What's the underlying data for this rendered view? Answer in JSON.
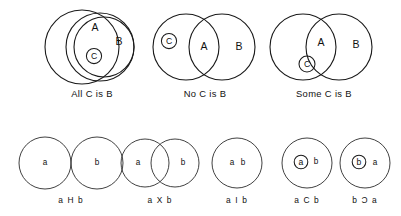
{
  "figure": {
    "background_color": "#ffffff",
    "ink_color": "#1a1a1a",
    "top_row": {
      "diagrams": [
        {
          "id": "all-c-is-b",
          "caption": "All  C is B",
          "set_labels": {
            "a": "A",
            "b": "B",
            "c": "C"
          },
          "relation": "C inside A, A inside B"
        },
        {
          "id": "no-c-is-b",
          "caption": "No C is B",
          "set_labels": {
            "a": "A",
            "b": "B",
            "c": "C"
          },
          "relation": "C outside B, A overlaps B"
        },
        {
          "id": "some-c-is-b",
          "caption": "Some C is B",
          "set_labels": {
            "a": "A",
            "b": "B",
            "c": "C"
          },
          "relation": "C straddles boundary of A and B"
        }
      ]
    },
    "bottom_row": {
      "diagrams": [
        {
          "id": "a-h-b",
          "label": "a H b",
          "left_token": "a",
          "right_token": "b",
          "relation": "disjoint"
        },
        {
          "id": "a-x-b",
          "label": "a X b",
          "left_token": "a",
          "right_token": "b",
          "relation": "overlapping"
        },
        {
          "id": "a-i-b",
          "label": "a I b",
          "left_token": "a",
          "right_token": "b",
          "relation": "identity"
        },
        {
          "id": "a-c-b",
          "label": "a C b",
          "left_token": "a",
          "right_token": "b",
          "relation": "a contained in b"
        },
        {
          "id": "b-sup-a",
          "label": "b Ɔ a",
          "left_token": "b",
          "right_token": "a",
          "relation": "b contained in a"
        }
      ]
    }
  }
}
